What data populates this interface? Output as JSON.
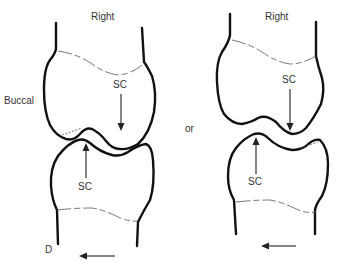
{
  "diagram": {
    "type": "dental-contact-illustration",
    "connector_label": "or",
    "figures": [
      {
        "id": "left",
        "top_label": "Right",
        "side_label": "Buccal",
        "upper_tooth_label": "SC",
        "lower_tooth_label": "SC",
        "direction_label": "D",
        "direction_arrow": "left"
      },
      {
        "id": "right",
        "top_label": "Right",
        "upper_tooth_label": "SC",
        "lower_tooth_label": "SC",
        "direction_arrow": "left"
      }
    ]
  },
  "colors": {
    "outline": "#111111",
    "cej_line": "#555555",
    "text": "#333333",
    "background": "#ffffff"
  }
}
